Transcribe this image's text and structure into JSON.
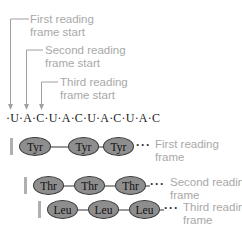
{
  "diagram": {
    "start_labels": [
      {
        "line1": "First reading",
        "line2": "frame start"
      },
      {
        "line1": "Second reading",
        "line2": "frame start"
      },
      {
        "line1": "Third reading",
        "line2": "frame start"
      }
    ],
    "sequence": "·U·A·C·U·A·C·U·A·C·U·A·C",
    "frames": [
      {
        "amino_acids": [
          "Tyr",
          "Tyr",
          "Tyr"
        ],
        "ellipsis": "···",
        "label_line1": "First reading",
        "label_line2": "frame"
      },
      {
        "amino_acids": [
          "Thr",
          "Thr",
          "Thr"
        ],
        "ellipsis": "···",
        "label_line1": "Second reading",
        "label_line2": "frame"
      },
      {
        "amino_acids": [
          "Leu",
          "Leu",
          "Leu"
        ],
        "ellipsis": "···",
        "label_line1": "Third reading",
        "label_line2": "frame"
      }
    ],
    "colors": {
      "label_text": "#a8a8a8",
      "leader_line": "#a0a0a0",
      "oval_fill": "#8e8e8e",
      "oval_border": "#3a3a3a",
      "frame_bar": "#b0b0b0"
    }
  }
}
